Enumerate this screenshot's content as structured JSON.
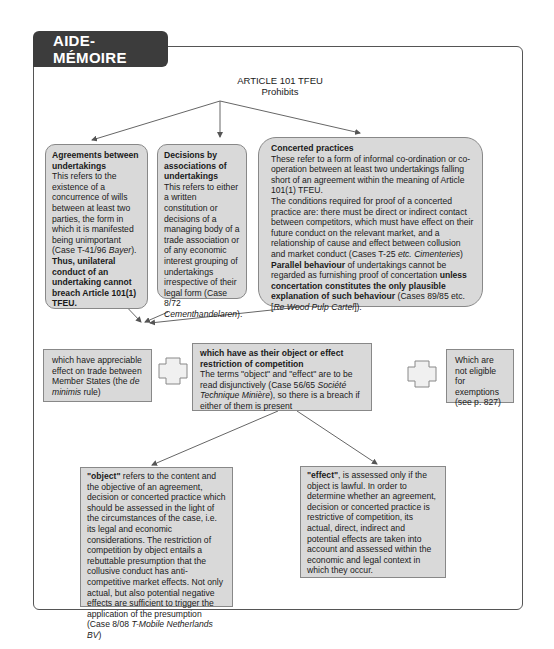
{
  "header": {
    "tab_title": "AIDE-MÉMOIRE"
  },
  "root": {
    "line1": "ARTICLE 101 TFEU",
    "line2": "Prohibits"
  },
  "forms": [
    {
      "title": "Agreements between undertakings",
      "text": "This refers to the existence of a concurrence of wills between at least two parties, the form in which it is manifested being unimportant (Case T-41/96 ",
      "case_italic": "Bayer",
      "text_after": ").",
      "bold_tail": "Thus, unilateral conduct of an undertaking cannot breach Article 101(1) TFEU."
    },
    {
      "title": "Decisions by associations of undertakings",
      "text": "This refers to either a written constitution or decisions of a managing body of a trade association or of any economic interest grouping of undertakings irrespective of their legal form (Case 8/72 ",
      "case_italic": "Cementhandelaren",
      "text_after": ")."
    },
    {
      "title": "Concerted practices",
      "text1": "These refer to a form of informal co-ordination or co-operation between at least two undertakings falling short of an agreement within the meaning of Article 101(1) TFEU.",
      "text2": "The conditions required for proof of a concerted practice are: there must be direct or indirect contact between competitors, which must have effect on their future conduct on the relevant market, and a relationship of cause and effect between collusion and market conduct (Cases T-25 ",
      "text2_italic_etc": "etc.",
      "text2_case_italic": "Cimenteries",
      "text2_after": ")",
      "bold1": "Parallel behaviour",
      "text3": " of undertakings cannot be regarded  as furnishing proof of concertation ",
      "bold2": "unless concertation constitutes the only plausible explanation of such behaviour",
      "text4": " (Cases 89/85 etc. [",
      "case4_italic": "Re Wood Pulp Cartel",
      "text4_after": "])."
    }
  ],
  "conditions": {
    "de_minimis": {
      "text": "which have appreciable effect on trade between Member States (the ",
      "italic": "de minimis",
      "after": " rule)"
    },
    "restriction": {
      "title": "which have as their object or effect restriction of competition",
      "text": "The terms \"object\" and \"effect\" are to be read disjunctively (Case 56/65 ",
      "italic": "Société Technique Minière",
      "after": "), so there is a breach if either of them is present"
    },
    "exemptions": {
      "text": "Which are not eligible for exemptions (see p. 827)"
    }
  },
  "branches": {
    "object": {
      "bold": "\"object\"",
      "text": " refers to the content and the objective of an agreement, decision or concerted practice which should be assessed in the light of the circumstances of the case, i.e. its legal and economic considerations. The restriction of competition by object entails a rebuttable presumption that the collusive conduct has anti-competitive market effects. Not only actual, but also potential negative effects are sufficient to trigger the application of the presumption (Case 8/08 ",
      "italic": "T-Mobile Netherlands BV",
      "after": ")"
    },
    "effect": {
      "bold": "\"effect\"",
      "text": ", is assessed only if the object is lawful. In order to determine whether an agreement, decision or concerted practice is restrictive of competition, its actual, direct, indirect and potential effects are taken into account and assessed within the economic and legal context in which they occur."
    }
  },
  "colors": {
    "box_fill": "#d9d9d9",
    "tab_fill": "#3c3c3c",
    "line": "#666666"
  }
}
